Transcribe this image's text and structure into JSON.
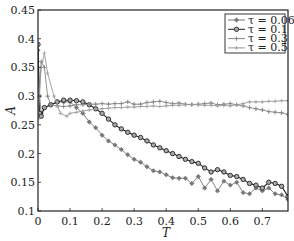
{
  "chart_data": {
    "type": "line",
    "title": "",
    "xlabel": "T",
    "ylabel": "A",
    "xlim": [
      0,
      0.78
    ],
    "ylim": [
      0.1,
      0.45
    ],
    "xticks": [
      "0",
      "0.1",
      "0.2",
      "0.3",
      "0.4",
      "0.5",
      "0.6",
      "0.7"
    ],
    "yticks": [
      "0.1",
      "0.15",
      "0.2",
      "0.25",
      "0.3",
      "0.35",
      "0.4",
      "0.45"
    ],
    "grid": false,
    "legend_position": "upper right",
    "series": [
      {
        "name": "τ = 0.06",
        "color": "#777777",
        "marker": "diamond",
        "x": [
          0,
          0.005,
          0.01,
          0.02,
          0.04,
          0.06,
          0.08,
          0.1,
          0.12,
          0.14,
          0.16,
          0.18,
          0.2,
          0.22,
          0.24,
          0.26,
          0.28,
          0.3,
          0.32,
          0.34,
          0.36,
          0.38,
          0.4,
          0.42,
          0.44,
          0.46,
          0.48,
          0.5,
          0.52,
          0.54,
          0.56,
          0.58,
          0.6,
          0.62,
          0.64,
          0.66,
          0.68,
          0.7,
          0.72,
          0.74,
          0.76,
          0.78
        ],
        "y": [
          0.38,
          0.3,
          0.27,
          0.28,
          0.285,
          0.29,
          0.29,
          0.29,
          0.28,
          0.27,
          0.255,
          0.245,
          0.232,
          0.222,
          0.215,
          0.207,
          0.198,
          0.19,
          0.185,
          0.177,
          0.17,
          0.168,
          0.163,
          0.158,
          0.157,
          0.157,
          0.148,
          0.16,
          0.14,
          0.155,
          0.135,
          0.152,
          0.145,
          0.15,
          0.132,
          0.13,
          0.14,
          0.135,
          0.14,
          0.13,
          0.128,
          0.12
        ]
      },
      {
        "name": "τ = 0.1",
        "color": "#222222",
        "marker": "circle",
        "x": [
          0,
          0.005,
          0.01,
          0.02,
          0.04,
          0.06,
          0.08,
          0.1,
          0.12,
          0.14,
          0.16,
          0.18,
          0.2,
          0.22,
          0.24,
          0.26,
          0.28,
          0.3,
          0.32,
          0.34,
          0.36,
          0.38,
          0.4,
          0.42,
          0.44,
          0.46,
          0.48,
          0.5,
          0.52,
          0.54,
          0.56,
          0.58,
          0.6,
          0.62,
          0.64,
          0.66,
          0.68,
          0.7,
          0.72,
          0.74,
          0.76,
          0.78
        ],
        "y": [
          0.39,
          0.27,
          0.265,
          0.28,
          0.285,
          0.29,
          0.293,
          0.293,
          0.292,
          0.29,
          0.285,
          0.278,
          0.27,
          0.26,
          0.25,
          0.243,
          0.237,
          0.232,
          0.228,
          0.222,
          0.215,
          0.21,
          0.205,
          0.2,
          0.195,
          0.19,
          0.186,
          0.183,
          0.175,
          0.168,
          0.172,
          0.168,
          0.162,
          0.16,
          0.155,
          0.148,
          0.145,
          0.14,
          0.15,
          0.148,
          0.143,
          0.125
        ]
      },
      {
        "name": "τ = 0.3",
        "color": "#888888",
        "marker": "plus",
        "x": [
          0,
          0.01,
          0.02,
          0.03,
          0.04,
          0.06,
          0.08,
          0.1,
          0.12,
          0.14,
          0.16,
          0.18,
          0.2,
          0.22,
          0.24,
          0.26,
          0.28,
          0.3,
          0.32,
          0.34,
          0.36,
          0.38,
          0.4,
          0.42,
          0.44,
          0.46,
          0.48,
          0.5,
          0.52,
          0.54,
          0.56,
          0.58,
          0.6,
          0.62,
          0.64,
          0.66,
          0.68,
          0.7,
          0.72,
          0.74,
          0.76,
          0.78
        ],
        "y": [
          0.27,
          0.36,
          0.35,
          0.3,
          0.285,
          0.283,
          0.282,
          0.283,
          0.285,
          0.285,
          0.286,
          0.286,
          0.287,
          0.286,
          0.287,
          0.287,
          0.29,
          0.286,
          0.286,
          0.289,
          0.29,
          0.291,
          0.289,
          0.287,
          0.288,
          0.286,
          0.285,
          0.286,
          0.287,
          0.288,
          0.285,
          0.286,
          0.287,
          0.285,
          0.283,
          0.28,
          0.278,
          0.276,
          0.273,
          0.272,
          0.271,
          0.268
        ]
      },
      {
        "name": "τ = 0.5",
        "color": "#999999",
        "marker": "thin-plus",
        "x": [
          0,
          0.01,
          0.02,
          0.03,
          0.05,
          0.07,
          0.09,
          0.1,
          0.12,
          0.14,
          0.16,
          0.18,
          0.2,
          0.22,
          0.24,
          0.26,
          0.28,
          0.3,
          0.32,
          0.34,
          0.36,
          0.38,
          0.4,
          0.42,
          0.44,
          0.46,
          0.48,
          0.5,
          0.52,
          0.54,
          0.56,
          0.58,
          0.6,
          0.62,
          0.64,
          0.66,
          0.68,
          0.7,
          0.72,
          0.74,
          0.76,
          0.78
        ],
        "y": [
          0.26,
          0.35,
          0.375,
          0.34,
          0.3,
          0.27,
          0.265,
          0.27,
          0.272,
          0.274,
          0.276,
          0.277,
          0.278,
          0.279,
          0.28,
          0.28,
          0.281,
          0.281,
          0.282,
          0.282,
          0.283,
          0.282,
          0.283,
          0.284,
          0.284,
          0.285,
          0.286,
          0.285,
          0.284,
          0.284,
          0.283,
          0.284,
          0.283,
          0.285,
          0.287,
          0.29,
          0.29,
          0.29,
          0.291,
          0.291,
          0.292,
          0.292
        ]
      }
    ]
  }
}
